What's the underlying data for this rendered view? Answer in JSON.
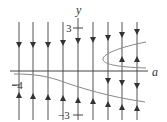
{
  "diagram": {
    "type": "bifurcation-diagram",
    "x_axis_label": "a",
    "y_axis_label": "y",
    "tick_labels": {
      "y_pos": "3",
      "y_neg": "−3",
      "a_neg": "−4"
    },
    "phase_lines": [
      {
        "x": 19,
        "arrows": [
          "down",
          "up"
        ]
      },
      {
        "x": 33,
        "arrows": [
          "down",
          "up"
        ]
      },
      {
        "x": 48,
        "arrows": [
          "down",
          "up"
        ]
      },
      {
        "x": 63,
        "arrows": [
          "down",
          "up"
        ]
      },
      {
        "x": 78,
        "arrows": [
          "down",
          "up"
        ]
      },
      {
        "x": 93,
        "arrows": [
          "down",
          "up"
        ]
      },
      {
        "x": 108,
        "arrows": [
          "down",
          "down",
          "up"
        ]
      },
      {
        "x": 122,
        "arrows": [
          "down",
          "up",
          "down",
          "up"
        ]
      },
      {
        "x": 137,
        "arrows": [
          "down",
          "up",
          "down",
          "up"
        ]
      }
    ],
    "colors": {
      "line": "#555555",
      "curve": "#888888",
      "axis": "#444444"
    }
  }
}
